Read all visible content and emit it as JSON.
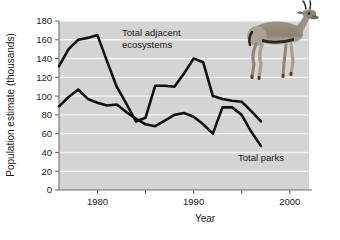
{
  "chart_data": {
    "type": "line",
    "title": "",
    "xlabel": "Year",
    "ylabel": "Population estimate (thousands)",
    "xlim": [
      1976,
      2002
    ],
    "ylim": [
      0,
      180
    ],
    "yticks": [
      0,
      20,
      40,
      60,
      80,
      100,
      120,
      140,
      160,
      180
    ],
    "ytick_labels": [
      "0",
      "20",
      "40",
      "60",
      "80",
      "100",
      "120",
      "140",
      "160",
      "180"
    ],
    "xticks": [
      1980,
      1985,
      1990,
      1995,
      2000
    ],
    "xtick_labels": [
      "1980",
      "",
      "1990",
      "",
      "2000"
    ],
    "grid": "horizontal",
    "legend_position": "inline-annotation",
    "plot_background": "#d4d4d4",
    "gridline_color": "#f2f2f2",
    "line_color": "#111111",
    "series": [
      {
        "name": "Total adjacent ecosystems",
        "x": [
          1976,
          1977,
          1978,
          1979,
          1980,
          1981,
          1982,
          1983,
          1984,
          1985,
          1986,
          1987,
          1988,
          1989,
          1990,
          1991,
          1992,
          1993,
          1994,
          1995,
          1996,
          1997
        ],
        "values": [
          132,
          150,
          160,
          162,
          165,
          137,
          110,
          92,
          73,
          77,
          111,
          111,
          110,
          124,
          140,
          136,
          100,
          97,
          95,
          94,
          84,
          73
        ]
      },
      {
        "name": "Total parks",
        "x": [
          1976,
          1977,
          1978,
          1979,
          1980,
          1981,
          1982,
          1983,
          1984,
          1985,
          1986,
          1987,
          1988,
          1989,
          1990,
          1991,
          1992,
          1993,
          1994,
          1995,
          1996,
          1997
        ],
        "values": [
          89,
          99,
          107,
          97,
          93,
          90,
          91,
          83,
          76,
          70,
          68,
          74,
          80,
          82,
          78,
          70,
          60,
          88,
          88,
          80,
          62,
          47
        ]
      }
    ],
    "annotations": [
      {
        "id": "adjacent-ecosystems-label",
        "line1": "Total adjacent",
        "line2": "ecosystems"
      },
      {
        "id": "total-parks-label",
        "line1": "Total parks",
        "line2": ""
      }
    ],
    "decorations": [
      {
        "id": "gazelle-photo",
        "name": "gazelle-photo",
        "alt": "Gazelle standing in profile"
      }
    ]
  }
}
